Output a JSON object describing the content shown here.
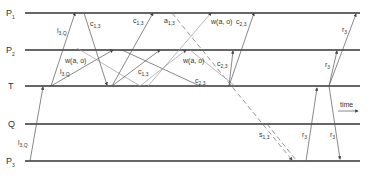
{
  "processes": [
    {
      "id": "P1",
      "name": "P",
      "sub": "1",
      "y": 13
    },
    {
      "id": "P2",
      "name": "P",
      "sub": "2",
      "y": 50
    },
    {
      "id": "T",
      "name": "T",
      "sub": "",
      "y": 86
    },
    {
      "id": "Q",
      "name": "Q",
      "sub": "",
      "y": 124
    },
    {
      "id": "P3",
      "name": "P",
      "sub": "3",
      "y": 161
    }
  ],
  "time_label": "time",
  "message_labels": [
    {
      "id": "l30_top",
      "base": "l",
      "sub": "3,Q"
    },
    {
      "id": "c13_a",
      "base": "c",
      "sub": "1,3"
    },
    {
      "id": "c13_b",
      "base": "c",
      "sub": "1,3"
    },
    {
      "id": "a13",
      "base": "a",
      "sub": "1,3"
    },
    {
      "id": "w_a_o_top",
      "base": "w(a, o)",
      "sub": ""
    },
    {
      "id": "c23_a",
      "base": "c",
      "sub": "2,3"
    },
    {
      "id": "r3_top",
      "base": "r",
      "sub": "3"
    },
    {
      "id": "w_a_o_left",
      "base": "w(a, o)",
      "sub": ""
    },
    {
      "id": "l30_mid",
      "base": "l",
      "sub": "3,Q"
    },
    {
      "id": "c13_c",
      "base": "c",
      "sub": "1,3"
    },
    {
      "id": "w_a_o_mid",
      "base": "w(a, o)",
      "sub": ""
    },
    {
      "id": "c23_b",
      "base": "c",
      "sub": "2,3"
    },
    {
      "id": "c23_c",
      "base": "c",
      "sub": "2,3"
    },
    {
      "id": "r3_mid",
      "base": "r",
      "sub": "3"
    },
    {
      "id": "l30_bot",
      "base": "l",
      "sub": "3,Q"
    },
    {
      "id": "s13",
      "base": "s",
      "sub": "1,3"
    },
    {
      "id": "r3_q1",
      "base": "r",
      "sub": "3"
    },
    {
      "id": "r3_q2",
      "base": "r",
      "sub": "3"
    }
  ]
}
